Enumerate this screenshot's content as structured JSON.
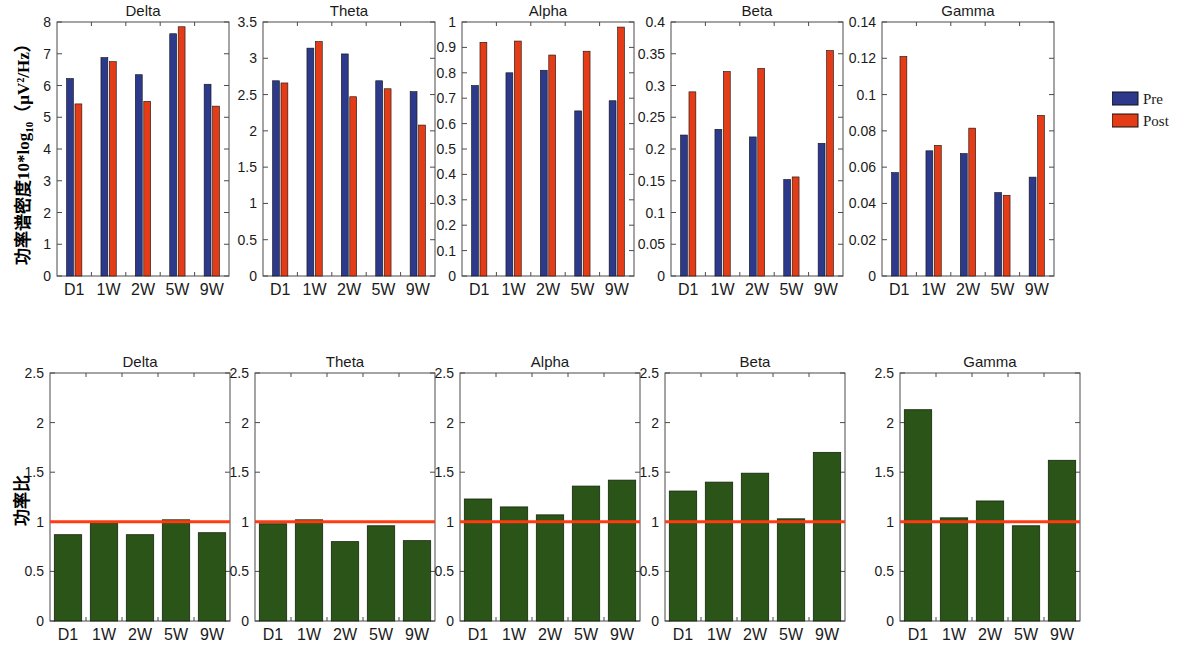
{
  "figure": {
    "width": 1184,
    "height": 651,
    "background": "#ffffff",
    "rows": [
      {
        "id": "psd-row",
        "ylabel": "功率谱密度10*log10（μV²/Hz）",
        "ylabel_parts": {
          "main": "功率谱密度10*log",
          "sub": "10",
          "tail": "（μV²/Hz）"
        }
      },
      {
        "id": "ratio-row",
        "ylabel": "功率比"
      }
    ]
  },
  "legend": {
    "position": "right",
    "entries": [
      {
        "label": "Pre",
        "color": "#2d3a8c"
      },
      {
        "label": "Post",
        "color": "#e43c17"
      }
    ]
  },
  "colors": {
    "pre": "#2d3a8c",
    "post": "#e43c17",
    "ratio_bar": "#2b5418",
    "reference_line": "#ff3b10",
    "axis": "#4a4a4a",
    "text": "#1a1a1a"
  },
  "chart_data": [
    {
      "id": "psd-delta",
      "row": "psd",
      "type": "bar",
      "title": "Delta",
      "categories": [
        "D1",
        "1W",
        "2W",
        "5W",
        "9W"
      ],
      "series": [
        {
          "name": "Pre",
          "color": "#2d3a8c",
          "values": [
            6.22,
            6.88,
            6.34,
            7.63,
            6.04
          ]
        },
        {
          "name": "Post",
          "color": "#e43c17",
          "values": [
            5.42,
            6.75,
            5.5,
            7.85,
            5.35
          ]
        }
      ],
      "ylim": [
        0,
        8
      ],
      "yticks": [
        0,
        1,
        2,
        3,
        4,
        5,
        6,
        7,
        8
      ],
      "yticklabels": [
        "0",
        "1",
        "2",
        "3",
        "4",
        "5",
        "6",
        "7",
        "8"
      ],
      "xlabel": "",
      "ylabel": "功率谱密度10*log10（μV²/Hz）",
      "grid": false,
      "legend": "none"
    },
    {
      "id": "psd-theta",
      "row": "psd",
      "type": "bar",
      "title": "Theta",
      "categories": [
        "D1",
        "1W",
        "2W",
        "5W",
        "9W"
      ],
      "series": [
        {
          "name": "Pre",
          "color": "#2d3a8c",
          "values": [
            2.69,
            3.14,
            3.06,
            2.69,
            2.54
          ]
        },
        {
          "name": "Post",
          "color": "#e43c17",
          "values": [
            2.66,
            3.23,
            2.47,
            2.58,
            2.08
          ]
        }
      ],
      "ylim": [
        0,
        3.5
      ],
      "yticks": [
        0,
        0.5,
        1,
        1.5,
        2,
        2.5,
        3,
        3.5
      ],
      "yticklabels": [
        "0",
        "0.5",
        "1",
        "1.5",
        "2",
        "2.5",
        "3",
        "3.5"
      ],
      "xlabel": "",
      "grid": false,
      "legend": "none"
    },
    {
      "id": "psd-alpha",
      "row": "psd",
      "type": "bar",
      "title": "Alpha",
      "categories": [
        "D1",
        "1W",
        "2W",
        "5W",
        "9W"
      ],
      "series": [
        {
          "name": "Pre",
          "color": "#2d3a8c",
          "values": [
            0.75,
            0.8,
            0.81,
            0.65,
            0.69
          ]
        },
        {
          "name": "Post",
          "color": "#e43c17",
          "values": [
            0.92,
            0.925,
            0.87,
            0.885,
            0.98
          ]
        }
      ],
      "ylim": [
        0,
        1
      ],
      "yticks": [
        0,
        0.1,
        0.2,
        0.3,
        0.4,
        0.5,
        0.6,
        0.7,
        0.8,
        0.9,
        1
      ],
      "yticklabels": [
        "0",
        "0.1",
        "0.2",
        "0.3",
        "0.4",
        "0.5",
        "0.6",
        "0.7",
        "0.8",
        "0.9",
        "1"
      ],
      "xlabel": "",
      "grid": false,
      "legend": "none"
    },
    {
      "id": "psd-beta",
      "row": "psd",
      "type": "bar",
      "title": "Beta",
      "categories": [
        "D1",
        "1W",
        "2W",
        "5W",
        "9W"
      ],
      "series": [
        {
          "name": "Pre",
          "color": "#2d3a8c",
          "values": [
            0.222,
            0.231,
            0.219,
            0.152,
            0.209
          ]
        },
        {
          "name": "Post",
          "color": "#e43c17",
          "values": [
            0.29,
            0.322,
            0.327,
            0.156,
            0.355
          ]
        }
      ],
      "ylim": [
        0,
        0.4
      ],
      "yticks": [
        0,
        0.05,
        0.1,
        0.15,
        0.2,
        0.25,
        0.3,
        0.35,
        0.4
      ],
      "yticklabels": [
        "0",
        "0.05",
        "0.1",
        "0.15",
        "0.2",
        "0.25",
        "0.3",
        "0.35",
        "0.4"
      ],
      "xlabel": "",
      "grid": false,
      "legend": "none"
    },
    {
      "id": "psd-gamma",
      "row": "psd",
      "type": "bar",
      "title": "Gamma",
      "categories": [
        "D1",
        "1W",
        "2W",
        "5W",
        "9W"
      ],
      "series": [
        {
          "name": "Pre",
          "color": "#2d3a8c",
          "values": [
            0.057,
            0.069,
            0.0675,
            0.046,
            0.0545
          ]
        },
        {
          "name": "Post",
          "color": "#e43c17",
          "values": [
            0.121,
            0.072,
            0.0815,
            0.0445,
            0.0885
          ]
        }
      ],
      "ylim": [
        0,
        0.14
      ],
      "yticks": [
        0,
        0.02,
        0.04,
        0.06,
        0.08,
        0.1,
        0.12,
        0.14
      ],
      "yticklabels": [
        "0",
        "0.02",
        "0.04",
        "0.06",
        "0.08",
        "0.1",
        "0.12",
        "0.14"
      ],
      "xlabel": "",
      "grid": false,
      "legend": "right"
    },
    {
      "id": "ratio-delta",
      "row": "ratio",
      "type": "bar",
      "title": "Delta",
      "categories": [
        "D1",
        "1W",
        "2W",
        "5W",
        "9W"
      ],
      "series": [
        {
          "name": "Post/Pre",
          "color": "#2b5418",
          "values": [
            0.87,
            0.99,
            0.87,
            1.02,
            0.89
          ]
        }
      ],
      "reference_line": {
        "value": 1,
        "color": "#ff3b10"
      },
      "ylim": [
        0,
        2.5
      ],
      "yticks": [
        0,
        0.5,
        1,
        1.5,
        2,
        2.5
      ],
      "yticklabels": [
        "0",
        "0.5",
        "1",
        "1.5",
        "2",
        "2.5"
      ],
      "xlabel": "",
      "ylabel": "功率比",
      "grid": false,
      "legend": "none"
    },
    {
      "id": "ratio-theta",
      "row": "ratio",
      "type": "bar",
      "title": "Theta",
      "categories": [
        "D1",
        "1W",
        "2W",
        "5W",
        "9W"
      ],
      "series": [
        {
          "name": "Post/Pre",
          "color": "#2b5418",
          "values": [
            0.98,
            1.02,
            0.8,
            0.96,
            0.81
          ]
        }
      ],
      "reference_line": {
        "value": 1,
        "color": "#ff3b10"
      },
      "ylim": [
        0,
        2.5
      ],
      "yticks": [
        0,
        0.5,
        1,
        1.5,
        2,
        2.5
      ],
      "yticklabels": [
        "0",
        "0.5",
        "1",
        "1.5",
        "2",
        "2.5"
      ],
      "xlabel": "",
      "grid": false,
      "legend": "none"
    },
    {
      "id": "ratio-alpha",
      "row": "ratio",
      "type": "bar",
      "title": "Alpha",
      "categories": [
        "D1",
        "1W",
        "2W",
        "5W",
        "9W"
      ],
      "series": [
        {
          "name": "Post/Pre",
          "color": "#2b5418",
          "values": [
            1.23,
            1.15,
            1.07,
            1.36,
            1.42
          ]
        }
      ],
      "reference_line": {
        "value": 1,
        "color": "#ff3b10"
      },
      "ylim": [
        0,
        2.5
      ],
      "yticks": [
        0,
        0.5,
        1,
        1.5,
        2,
        2.5
      ],
      "yticklabels": [
        "0",
        "0.5",
        "1",
        "1.5",
        "2",
        "2.5"
      ],
      "xlabel": "",
      "grid": false,
      "legend": "none"
    },
    {
      "id": "ratio-beta",
      "row": "ratio",
      "type": "bar",
      "title": "Beta",
      "categories": [
        "D1",
        "1W",
        "2W",
        "5W",
        "9W"
      ],
      "series": [
        {
          "name": "Post/Pre",
          "color": "#2b5418",
          "values": [
            1.31,
            1.4,
            1.49,
            1.03,
            1.7
          ]
        }
      ],
      "reference_line": {
        "value": 1,
        "color": "#ff3b10"
      },
      "ylim": [
        0,
        2.5
      ],
      "yticks": [
        0,
        0.5,
        1,
        1.5,
        2,
        2.5
      ],
      "yticklabels": [
        "0",
        "0.5",
        "1",
        "1.5",
        "2",
        "2.5"
      ],
      "xlabel": "",
      "grid": false,
      "legend": "none"
    },
    {
      "id": "ratio-gamma",
      "row": "ratio",
      "type": "bar",
      "title": "Gamma",
      "categories": [
        "D1",
        "1W",
        "2W",
        "5W",
        "9W"
      ],
      "series": [
        {
          "name": "Post/Pre",
          "color": "#2b5418",
          "values": [
            2.13,
            1.04,
            1.21,
            0.96,
            1.62
          ]
        }
      ],
      "reference_line": {
        "value": 1,
        "color": "#ff3b10"
      },
      "ylim": [
        0,
        2.5
      ],
      "yticks": [
        0,
        0.5,
        1,
        1.5,
        2,
        2.5
      ],
      "yticklabels": [
        "0",
        "0.5",
        "1",
        "1.5",
        "2",
        "2.5"
      ],
      "xlabel": "",
      "grid": false,
      "legend": "none"
    }
  ],
  "layout": {
    "psd_panels": [
      {
        "id": "psd-delta",
        "x": 57,
        "y": 22,
        "w": 172,
        "h": 254
      },
      {
        "id": "psd-theta",
        "x": 263,
        "y": 22,
        "w": 172,
        "h": 254
      },
      {
        "id": "psd-alpha",
        "x": 462,
        "y": 22,
        "w": 172,
        "h": 254
      },
      {
        "id": "psd-beta",
        "x": 671,
        "y": 22,
        "w": 172,
        "h": 254
      },
      {
        "id": "psd-gamma",
        "x": 882,
        "y": 22,
        "w": 172,
        "h": 254
      }
    ],
    "ratio_panels": [
      {
        "id": "ratio-delta",
        "x": 50,
        "y": 373,
        "w": 180,
        "h": 248
      },
      {
        "id": "ratio-theta",
        "x": 255,
        "y": 373,
        "w": 180,
        "h": 248
      },
      {
        "id": "ratio-alpha",
        "x": 460,
        "y": 373,
        "w": 180,
        "h": 248
      },
      {
        "id": "ratio-beta",
        "x": 665,
        "y": 373,
        "w": 180,
        "h": 248
      },
      {
        "id": "ratio-gamma",
        "x": 900,
        "y": 373,
        "w": 180,
        "h": 248
      }
    ],
    "legend_box": {
      "x": 1112,
      "y": 88,
      "w": 28,
      "h": 44
    },
    "psd_ylabel_pos": {
      "x": 22,
      "y": 150
    },
    "ratio_ylabel_pos": {
      "x": 20,
      "y": 500
    }
  }
}
